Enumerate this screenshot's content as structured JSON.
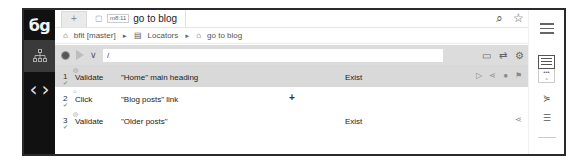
{
  "app": {
    "logo": "бg"
  },
  "tabs": {
    "add_label": "+",
    "active": {
      "badge": "m8:11",
      "label": "go to blog"
    }
  },
  "breadcrumb": {
    "items": [
      "bfit [master]",
      "Locators",
      "go to blog"
    ],
    "separator": "►"
  },
  "toolbar": {
    "path_value": "/"
  },
  "steps": [
    {
      "num": "1",
      "action": "Validate",
      "target": "\"Home\" main heading",
      "value": "Exist",
      "active": true
    },
    {
      "num": "2",
      "action": "Click",
      "target": "\"Blog posts\" link",
      "value": "",
      "active": false
    },
    {
      "num": "3",
      "action": "Validate",
      "target": "\"Older posts\"",
      "value": "Exist",
      "active": false
    }
  ],
  "colors": {
    "leftbar": "#111111",
    "toolbar_bg": "#dcdcdc",
    "active_row": "#d9d9d9",
    "check": "#7aa86b"
  }
}
